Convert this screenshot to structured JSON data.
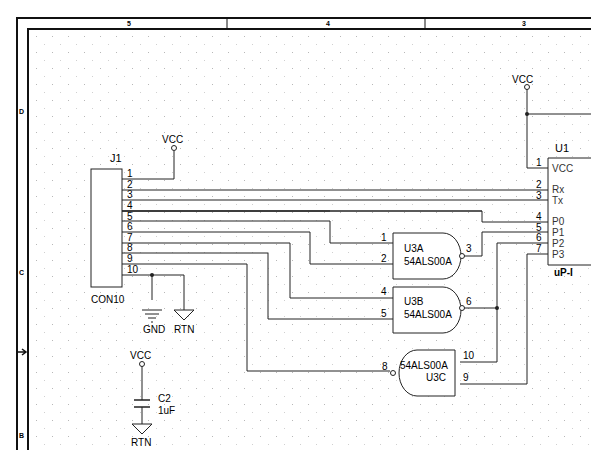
{
  "sheet": {
    "zone_columns": [
      "5",
      "4",
      "3"
    ],
    "zone_rows": [
      "D",
      "C",
      "B"
    ],
    "grid_color": "#b0b0b0",
    "line_color": "#222222"
  },
  "connector": {
    "ref": "J1",
    "part": "CON10",
    "pins": [
      "1",
      "2",
      "3",
      "4",
      "5",
      "6",
      "7",
      "8",
      "9",
      "10"
    ]
  },
  "power": {
    "vcc_label": "VCC",
    "gnd_label": "GND",
    "rtn_label": "RTN"
  },
  "gates": {
    "u3a": {
      "ref": "U3A",
      "part": "54ALS00A",
      "in1": "1",
      "in2": "2",
      "out": "3"
    },
    "u3b": {
      "ref": "U3B",
      "part": "54ALS00A",
      "in1": "4",
      "in2": "5",
      "out": "6"
    },
    "u3c": {
      "ref": "U3C",
      "part": "54ALS00A",
      "in1": "10",
      "in2": "9",
      "out": "8"
    }
  },
  "capacitor": {
    "ref": "C2",
    "value": "1uF"
  },
  "mcu": {
    "ref": "U1",
    "part": "uP-I",
    "pins": [
      {
        "num": "1",
        "name": "VCC"
      },
      {
        "num": "2",
        "name": "Rx"
      },
      {
        "num": "3",
        "name": "Tx"
      },
      {
        "num": "4",
        "name": "P0"
      },
      {
        "num": "5",
        "name": "P1"
      },
      {
        "num": "6",
        "name": "P2"
      },
      {
        "num": "7",
        "name": "P3"
      }
    ]
  }
}
